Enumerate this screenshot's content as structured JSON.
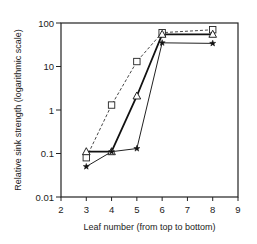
{
  "chart_data": {
    "type": "line",
    "title": "",
    "xlabel": "Leaf number (from top to bottom)",
    "ylabel": "Relative sink strength (logarithmic scale)",
    "xlim": [
      2,
      9
    ],
    "ylim": [
      0.01,
      100
    ],
    "yscale": "log",
    "xticks": [
      "2",
      "3",
      "4",
      "5",
      "6",
      "7",
      "8",
      "9"
    ],
    "yticks": [
      "0.01",
      "0.1",
      "1",
      "10",
      "100"
    ],
    "grid": false,
    "legend": "none",
    "series": [
      {
        "name": "squares",
        "marker": "square",
        "line": "dashed",
        "x": [
          3,
          4,
          5,
          6,
          8
        ],
        "values": [
          0.08,
          1.3,
          13,
          60,
          70
        ]
      },
      {
        "name": "triangles",
        "marker": "triangle",
        "line": "solid-thick",
        "x": [
          3,
          4,
          5,
          6,
          8
        ],
        "values": [
          0.11,
          0.11,
          2.1,
          55,
          55
        ]
      },
      {
        "name": "stars",
        "marker": "star",
        "line": "solid",
        "x": [
          3,
          4,
          5,
          6,
          8
        ],
        "values": [
          0.05,
          0.11,
          0.13,
          35,
          34
        ]
      }
    ]
  }
}
